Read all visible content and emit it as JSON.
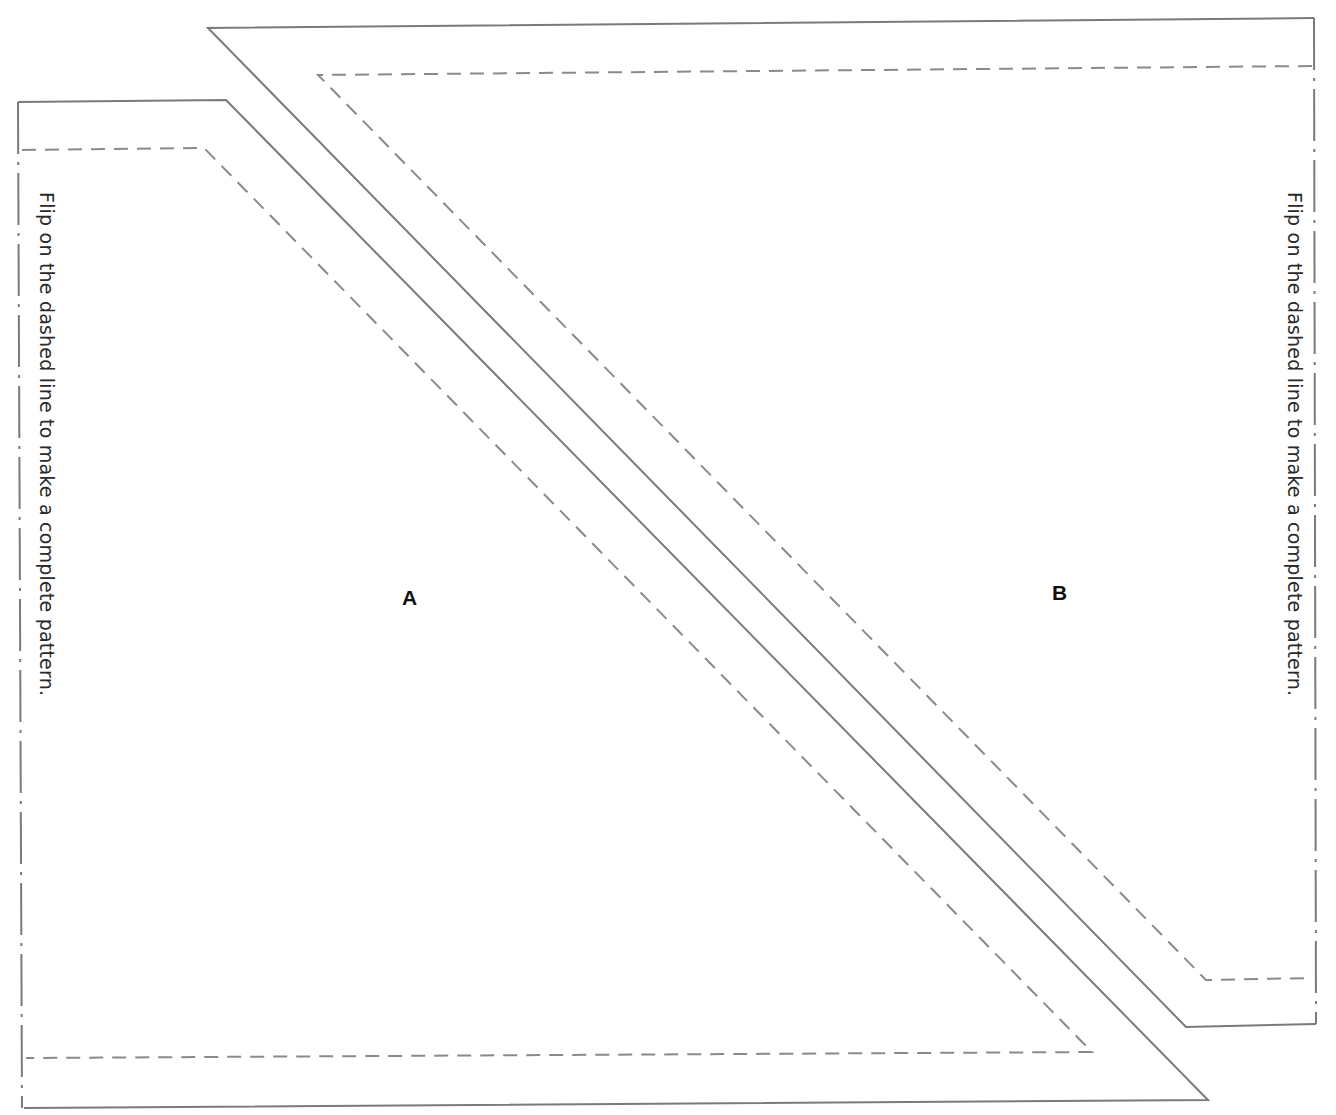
{
  "page": {
    "type": "sewing-pattern-template",
    "background": "#ffffff",
    "line_color": "#777777"
  },
  "pieces": [
    {
      "id": "A",
      "label": "A",
      "cut_line": "solid",
      "seam_line": "dashed",
      "fold_edge": "left",
      "fold_instruction": "Flip on the dashed line to make a complete pattern."
    },
    {
      "id": "B",
      "label": "B",
      "cut_line": "solid",
      "seam_line": "dashed",
      "fold_edge": "right",
      "fold_instruction": "Flip on the dashed line to make a complete pattern."
    }
  ],
  "annotations": {
    "left_instruction": "Flip on the dashed line to make a complete pattern.",
    "right_instruction": "Flip on the dashed line to make a complete pattern.",
    "label_a": "A",
    "label_b": "B"
  },
  "legend": {
    "solid_line": "cutting line",
    "dashed_line": "seam line",
    "dash_dot_line": "fold line"
  }
}
